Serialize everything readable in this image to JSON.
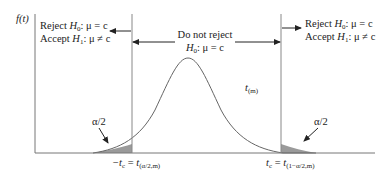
{
  "figure": {
    "y_axis_label": "f(t)",
    "curve_label": {
      "main": "t",
      "sub": "(m)"
    },
    "left_region": {
      "line1": {
        "prefix": "Reject ",
        "var": "H",
        "sub": "0",
        "suffix": ": μ = c"
      },
      "line2": {
        "prefix": "Accept ",
        "var": "H",
        "sub": "1",
        "suffix": ": μ ≠ c"
      }
    },
    "right_region": {
      "line1": {
        "prefix": "Reject ",
        "var": "H",
        "sub": "0",
        "suffix": ": μ = c"
      },
      "line2": {
        "prefix": "Accept ",
        "var": "H",
        "sub": "1",
        "suffix": ": μ ≠ c"
      }
    },
    "middle_region": {
      "line1": "Do not reject",
      "line2": {
        "var": "H",
        "sub": "0",
        "suffix": ": μ = c"
      }
    },
    "left_tail_label": "α/2",
    "right_tail_label": "α/2",
    "left_critical": {
      "lhs": "−t",
      "lhs_sub": "c",
      "eq": " = ",
      "rhs": "t",
      "rhs_sub": "(α/2,m)"
    },
    "right_critical": {
      "lhs": "t",
      "lhs_sub": "c",
      "eq": " = ",
      "rhs": "t",
      "rhs_sub": "(1−α/2,m)"
    },
    "colors": {
      "line": "#555555",
      "axis": "#777777",
      "shade": "#9a9a9a",
      "text": "#222222"
    }
  }
}
